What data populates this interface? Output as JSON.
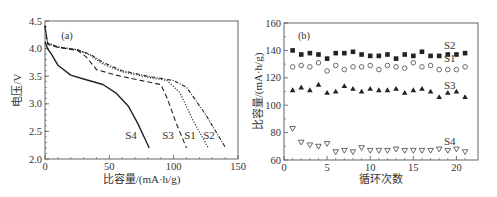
{
  "chart_data": [
    {
      "type": "line",
      "panel_label": "(a)",
      "xlabel": "比容量/(mA·h/g)",
      "ylabel": "电压/V",
      "xlim": [
        0,
        150
      ],
      "ylim": [
        2.0,
        4.5
      ],
      "xticks": [
        "0",
        "50",
        "100",
        "150"
      ],
      "yticks": [
        "2.0",
        "2.5",
        "3.0",
        "3.5",
        "4.0",
        "4.5"
      ],
      "grid": false,
      "series": [
        {
          "name": "S1",
          "style": "dotted",
          "x": [
            0,
            2,
            10,
            25,
            35,
            45,
            60,
            80,
            95,
            105,
            115,
            127
          ],
          "y": [
            4.4,
            4.1,
            4.03,
            3.98,
            3.88,
            3.72,
            3.58,
            3.48,
            3.42,
            3.2,
            2.7,
            2.2
          ]
        },
        {
          "name": "S2",
          "style": "dash-dot",
          "x": [
            0,
            2,
            10,
            25,
            35,
            45,
            60,
            80,
            100,
            110,
            125,
            140
          ],
          "y": [
            4.42,
            4.1,
            4.03,
            3.98,
            3.9,
            3.75,
            3.6,
            3.5,
            3.42,
            3.3,
            2.8,
            2.22
          ]
        },
        {
          "name": "S3",
          "style": "dashed",
          "x": [
            0,
            2,
            10,
            25,
            32,
            40,
            55,
            75,
            90,
            95,
            102,
            110
          ],
          "y": [
            4.4,
            4.08,
            4.02,
            3.97,
            3.85,
            3.62,
            3.52,
            3.42,
            3.35,
            3.1,
            2.65,
            2.2
          ]
        },
        {
          "name": "S4",
          "style": "solid",
          "x": [
            0,
            2,
            5,
            10,
            20,
            30,
            45,
            55,
            65,
            72,
            78,
            81
          ],
          "y": [
            4.12,
            4.0,
            3.9,
            3.7,
            3.52,
            3.45,
            3.35,
            3.2,
            2.95,
            2.65,
            2.35,
            2.2
          ]
        }
      ],
      "annotations": [
        "S4",
        "S3",
        "S1",
        "S2"
      ]
    },
    {
      "type": "scatter",
      "panel_label": "(b)",
      "xlabel": "循环次数",
      "ylabel": "比容量/(mA·h/g)",
      "xlim": [
        0,
        22.5
      ],
      "ylim": [
        60,
        160
      ],
      "xticks": [
        "0",
        "5",
        "10",
        "15",
        "20"
      ],
      "yticks": [
        "60",
        "80",
        "100",
        "120",
        "140",
        "160"
      ],
      "grid": false,
      "x": [
        1,
        2,
        3,
        4,
        5,
        6,
        7,
        8,
        9,
        10,
        11,
        12,
        13,
        14,
        15,
        16,
        17,
        18,
        19,
        20,
        21
      ],
      "series": [
        {
          "name": "S2",
          "marker": "filled-square",
          "values": [
            140,
            137,
            138,
            137,
            134,
            138,
            138,
            139,
            137,
            136,
            136,
            137,
            134,
            137,
            136,
            139,
            136,
            136,
            137,
            137,
            138
          ]
        },
        {
          "name": "S1",
          "marker": "open-circle",
          "values": [
            128,
            129,
            128,
            131,
            125,
            129,
            126,
            128,
            128,
            129,
            126,
            129,
            128,
            127,
            131,
            128,
            129,
            126,
            126,
            126,
            128
          ]
        },
        {
          "name": "S3",
          "marker": "filled-triangle",
          "values": [
            111,
            113,
            111,
            115,
            109,
            110,
            114,
            112,
            110,
            112,
            111,
            111,
            112,
            109,
            111,
            112,
            110,
            106,
            109,
            110,
            106
          ]
        },
        {
          "name": "S4",
          "marker": "open-down-triangle",
          "values": [
            83,
            73,
            71,
            70,
            72,
            66,
            67,
            66,
            69,
            67,
            67,
            67,
            68,
            67,
            67,
            67,
            67,
            68,
            67,
            68,
            66
          ]
        }
      ],
      "annotations": [
        "S2",
        "S1",
        "S3",
        "S4"
      ]
    }
  ]
}
